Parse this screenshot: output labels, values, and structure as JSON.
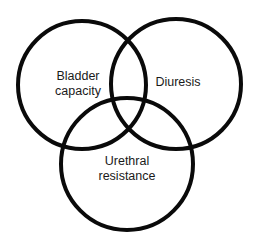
{
  "diagram": {
    "type": "venn",
    "stroke_color": "#0a0a0a",
    "background": "#ffffff",
    "circles": [
      {
        "id": "bladder-capacity",
        "label_lines": [
          "Bladder",
          "capacity"
        ],
        "cx": 82,
        "cy": 85,
        "r": 64
      },
      {
        "id": "diuresis",
        "label_lines": [
          "Diuresis"
        ],
        "cx": 176,
        "cy": 84,
        "r": 65
      },
      {
        "id": "urethral-resistance",
        "label_lines": [
          "Urethral",
          "resistance"
        ],
        "cx": 127,
        "cy": 164,
        "r": 66
      }
    ]
  }
}
